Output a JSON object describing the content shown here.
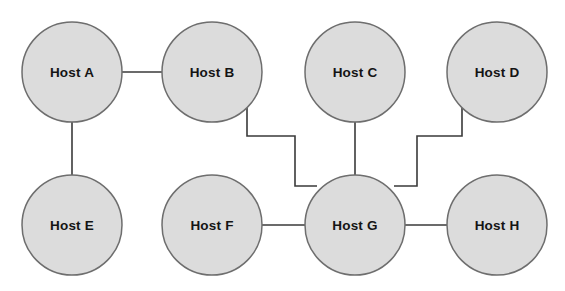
{
  "diagram": {
    "background_color": "#ffffff",
    "node_fill_color": "#dcdcdc",
    "node_border_color": "#6e6e6e",
    "link_color": "#3a3a3a",
    "label_color": "#141414",
    "width": 565,
    "height": 291
  },
  "nodes": [
    {
      "id": "A",
      "label": "Host A",
      "cx": 72,
      "cy": 72,
      "r": 50
    },
    {
      "id": "B",
      "label": "Host B",
      "cx": 212,
      "cy": 72,
      "r": 50
    },
    {
      "id": "C",
      "label": "Host C",
      "cx": 355,
      "cy": 72,
      "r": 50
    },
    {
      "id": "D",
      "label": "Host D",
      "cx": 497,
      "cy": 72,
      "r": 50
    },
    {
      "id": "E",
      "label": "Host E",
      "cx": 72,
      "cy": 225,
      "r": 50
    },
    {
      "id": "F",
      "label": "Host F",
      "cx": 212,
      "cy": 225,
      "r": 50
    },
    {
      "id": "G",
      "label": "Host G",
      "cx": 355,
      "cy": 225,
      "r": 50
    },
    {
      "id": "H",
      "label": "Host H",
      "cx": 497,
      "cy": 225,
      "r": 50
    }
  ],
  "links": [
    {
      "id": "A-B",
      "from": "A",
      "to": "B",
      "style": "straight-horizontal",
      "path": "M 122 72 L 162 72"
    },
    {
      "id": "A-E",
      "from": "A",
      "to": "E",
      "style": "straight-vertical",
      "path": "M 72 122 L 72 175"
    },
    {
      "id": "C-G",
      "from": "C",
      "to": "G",
      "style": "straight-vertical",
      "path": "M 355 122 L 355 175"
    },
    {
      "id": "F-G",
      "from": "F",
      "to": "G",
      "style": "straight-horizontal",
      "path": "M 262 225 L 305 225"
    },
    {
      "id": "G-H",
      "from": "G",
      "to": "H",
      "style": "straight-horizontal",
      "path": "M 405 225 L 447 225"
    },
    {
      "id": "B-G",
      "from": "B",
      "to": "G",
      "style": "orthogonal-zigzag",
      "path": "M 247 108 L 247 136 L 295 136 L 295 186 L 317 186"
    },
    {
      "id": "D-G",
      "from": "D",
      "to": "G",
      "style": "orthogonal-zigzag",
      "path": "M 462 108 L 462 136 L 417 136 L 417 186 L 394 186"
    }
  ]
}
